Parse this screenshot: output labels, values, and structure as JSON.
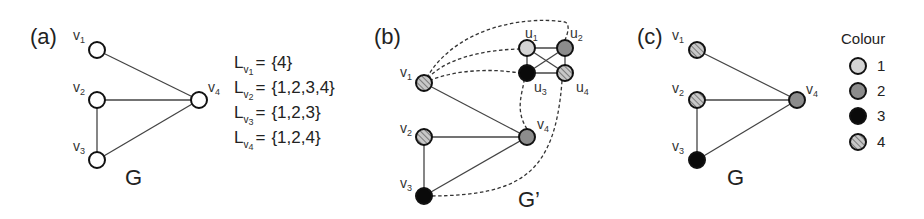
{
  "figure": {
    "colors": {
      "empty": "#ffffff",
      "colour_1": "#d4d4d4",
      "colour_2": "#8c8c8c",
      "colour_3": "#0a0a0a",
      "colour_4_base": "#c8c8c8",
      "colour_4_stripe": "#7a7a7a",
      "stroke": "#111111"
    },
    "panel_a": {
      "label": "(a)",
      "graph_name": "G",
      "nodes": [
        {
          "id": "v1",
          "letter": "v",
          "sub": "1",
          "fill": "empty"
        },
        {
          "id": "v2",
          "letter": "v",
          "sub": "2",
          "fill": "empty"
        },
        {
          "id": "v3",
          "letter": "v",
          "sub": "3",
          "fill": "empty"
        },
        {
          "id": "v4",
          "letter": "v",
          "sub": "4",
          "fill": "empty"
        }
      ],
      "edges": [
        [
          "v1",
          "v4"
        ],
        [
          "v2",
          "v4"
        ],
        [
          "v2",
          "v3"
        ],
        [
          "v3",
          "v4"
        ]
      ],
      "lists": [
        {
          "letter": "L",
          "sub_letter": "v",
          "sub": "1",
          "eq": "=",
          "value": "{4}"
        },
        {
          "letter": "L",
          "sub_letter": "v",
          "sub": "2",
          "eq": "=",
          "value": "{1,2,3,4}"
        },
        {
          "letter": "L",
          "sub_letter": "v",
          "sub": "3",
          "eq": "=",
          "value": "{1,2,3}"
        },
        {
          "letter": "L",
          "sub_letter": "v",
          "sub": "4",
          "eq": "=",
          "value": "{1,2,4}"
        }
      ]
    },
    "panel_b": {
      "label": "(b)",
      "graph_name": "G’",
      "nodes": [
        {
          "id": "v1",
          "letter": "v",
          "sub": "1",
          "fill": "colour_4"
        },
        {
          "id": "v2",
          "letter": "v",
          "sub": "2",
          "fill": "colour_4"
        },
        {
          "id": "v3",
          "letter": "v",
          "sub": "3",
          "fill": "colour_3"
        },
        {
          "id": "v4",
          "letter": "v",
          "sub": "4",
          "fill": "colour_2"
        },
        {
          "id": "u1",
          "letter": "u",
          "sub": "1",
          "fill": "colour_1"
        },
        {
          "id": "u2",
          "letter": "u",
          "sub": "2",
          "fill": "colour_2"
        },
        {
          "id": "u3",
          "letter": "u",
          "sub": "3",
          "fill": "colour_3"
        },
        {
          "id": "u4",
          "letter": "u",
          "sub": "4",
          "fill": "colour_4"
        }
      ],
      "solid_edges": [
        [
          "v1",
          "v4"
        ],
        [
          "v2",
          "v4"
        ],
        [
          "v2",
          "v3"
        ],
        [
          "v3",
          "v4"
        ],
        [
          "u1",
          "u2"
        ],
        [
          "u1",
          "u3"
        ],
        [
          "u1",
          "u4"
        ],
        [
          "u2",
          "u3"
        ],
        [
          "u2",
          "u4"
        ],
        [
          "u3",
          "u4"
        ]
      ],
      "dashed_edges": [
        [
          "v1",
          "u1"
        ],
        [
          "v1",
          "u2"
        ],
        [
          "v1",
          "u3"
        ],
        [
          "v4",
          "u3"
        ],
        [
          "v3",
          "u4"
        ]
      ]
    },
    "panel_c": {
      "label": "(c)",
      "graph_name": "G",
      "nodes": [
        {
          "id": "v1",
          "letter": "v",
          "sub": "1",
          "fill": "colour_4"
        },
        {
          "id": "v2",
          "letter": "v",
          "sub": "2",
          "fill": "colour_4"
        },
        {
          "id": "v3",
          "letter": "v",
          "sub": "3",
          "fill": "colour_3"
        },
        {
          "id": "v4",
          "letter": "v",
          "sub": "4",
          "fill": "colour_2"
        }
      ],
      "edges": [
        [
          "v1",
          "v4"
        ],
        [
          "v2",
          "v4"
        ],
        [
          "v2",
          "v3"
        ],
        [
          "v3",
          "v4"
        ]
      ]
    },
    "legend": {
      "title": "Colour",
      "items": [
        {
          "label": "1",
          "fill": "colour_1"
        },
        {
          "label": "2",
          "fill": "colour_2"
        },
        {
          "label": "3",
          "fill": "colour_3"
        },
        {
          "label": "4",
          "fill": "colour_4"
        }
      ]
    }
  }
}
